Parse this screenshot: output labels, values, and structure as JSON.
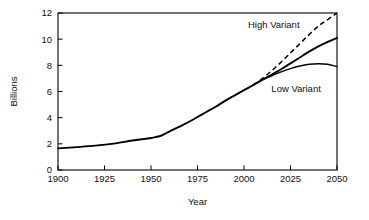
{
  "chart_data": {
    "type": "line",
    "title": "",
    "xlabel": "Year",
    "ylabel": "Billions",
    "xlim": [
      1900,
      2050
    ],
    "ylim": [
      0,
      12
    ],
    "xticks": [
      1900,
      1925,
      1950,
      1975,
      2000,
      2025,
      2050
    ],
    "yticks": [
      0,
      2,
      4,
      6,
      8,
      10,
      12
    ],
    "xtick_labels": [
      "1900",
      "1925",
      "1950",
      "1975",
      "2000",
      "2025",
      "2050"
    ],
    "ytick_labels": [
      "0",
      "2",
      "4",
      "6",
      "8",
      "10",
      "12"
    ],
    "grid": false,
    "legend": "inline-annotations",
    "annotations": [
      {
        "text": "High Variant",
        "x": 2016,
        "y": 11.1
      },
      {
        "text": "Low Variant",
        "x": 2028,
        "y": 6.2
      }
    ],
    "series": [
      {
        "name": "Historical and medium variant",
        "style": "solid",
        "linewidth": 1.9,
        "x": [
          1900,
          1910,
          1920,
          1930,
          1940,
          1950,
          1955,
          1960,
          1965,
          1970,
          1975,
          1980,
          1985,
          1990,
          1995,
          2000,
          2005,
          2010,
          2015,
          2020,
          2025,
          2030,
          2035,
          2040,
          2045,
          2050
        ],
        "values": [
          1.65,
          1.75,
          1.86,
          2.02,
          2.25,
          2.45,
          2.6,
          2.95,
          3.3,
          3.65,
          4.05,
          4.45,
          4.85,
          5.3,
          5.7,
          6.1,
          6.5,
          6.9,
          7.3,
          7.7,
          8.15,
          8.6,
          9.05,
          9.45,
          9.8,
          10.1
        ]
      },
      {
        "name": "High Variant",
        "style": "dashed",
        "linewidth": 1.5,
        "x": [
          2005,
          2010,
          2015,
          2020,
          2025,
          2030,
          2035,
          2040,
          2045,
          2050
        ],
        "values": [
          6.5,
          7.0,
          7.6,
          8.25,
          8.95,
          9.65,
          10.35,
          11.0,
          11.5,
          12.0
        ]
      },
      {
        "name": "Low Variant",
        "style": "solid",
        "linewidth": 1.35,
        "x": [
          2005,
          2010,
          2015,
          2020,
          2025,
          2030,
          2035,
          2040,
          2045,
          2050
        ],
        "values": [
          6.5,
          6.9,
          7.2,
          7.5,
          7.75,
          7.95,
          8.08,
          8.12,
          8.08,
          7.9
        ]
      }
    ]
  }
}
